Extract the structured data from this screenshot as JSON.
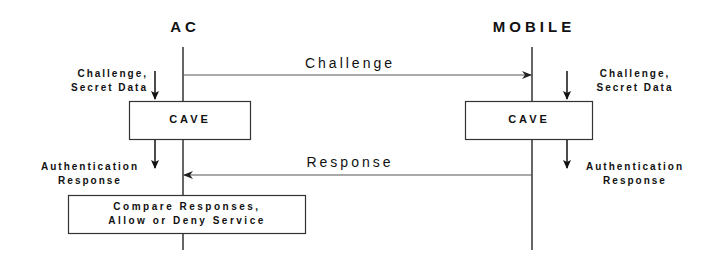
{
  "diagram": {
    "type": "sequence-diagram",
    "entities": [
      {
        "id": "ac",
        "label": "AC"
      },
      {
        "id": "mobile",
        "label": "MOBILE"
      }
    ],
    "messages": [
      {
        "label": "Challenge",
        "from": "ac",
        "to": "mobile"
      },
      {
        "label": "Response",
        "from": "mobile",
        "to": "ac"
      }
    ],
    "ac_side": {
      "input_label_line1": "Challenge,",
      "input_label_line2": "Secret Data",
      "process_box": "CAVE",
      "output_label_line1": "Authentication",
      "output_label_line2": "Response",
      "compare_line1": "Compare Responses,",
      "compare_line2": "Allow or Deny Service"
    },
    "mobile_side": {
      "input_label_line1": "Challenge,",
      "input_label_line2": "Secret Data",
      "process_box": "CAVE",
      "output_label_line1": "Authentication",
      "output_label_line2": "Response"
    },
    "colors": {
      "line": "#333333",
      "text": "#111111",
      "background": "#ffffff"
    }
  }
}
